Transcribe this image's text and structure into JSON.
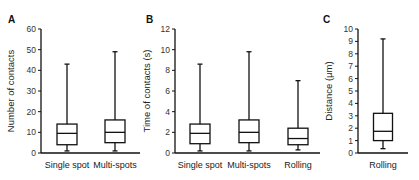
{
  "colors": {
    "stroke": "#111111",
    "box_fill": "#ffffff",
    "background": "#ffffff"
  },
  "chart_data": [
    {
      "panel": "A",
      "type": "box",
      "title": "",
      "xlabel": "",
      "ylabel": "Number of contacts",
      "ylim": [
        0,
        60
      ],
      "yticks": [
        0,
        10,
        20,
        30,
        40,
        50,
        60
      ],
      "grid": false,
      "categories": [
        "Single spot",
        "Multi-spots"
      ],
      "series": [
        {
          "name": "Single spot",
          "min": 1,
          "q1": 4,
          "median": 9.5,
          "q3": 14,
          "max": 43
        },
        {
          "name": "Multi-spots",
          "min": 1,
          "q1": 5,
          "median": 10,
          "q3": 16,
          "max": 49
        }
      ]
    },
    {
      "panel": "B",
      "type": "box",
      "title": "",
      "xlabel": "",
      "ylabel": "Time of contacts (s)",
      "ylim": [
        0,
        12
      ],
      "yticks": [
        0,
        2,
        4,
        6,
        8,
        10,
        12
      ],
      "grid": false,
      "categories": [
        "Single spot",
        "Multi-spots",
        "Rolling"
      ],
      "series": [
        {
          "name": "Single spot",
          "min": 0.2,
          "q1": 0.9,
          "median": 1.9,
          "q3": 2.8,
          "max": 8.6
        },
        {
          "name": "Multi-spots",
          "min": 0.2,
          "q1": 1.0,
          "median": 2.0,
          "q3": 3.2,
          "max": 9.8
        },
        {
          "name": "Rolling",
          "min": 0.3,
          "q1": 0.8,
          "median": 1.4,
          "q3": 2.4,
          "max": 7.0
        }
      ]
    },
    {
      "panel": "C",
      "type": "box",
      "title": "",
      "xlabel": "",
      "ylabel": "Distance (μm)",
      "ylim": [
        0,
        10
      ],
      "yticks": [
        0,
        1,
        2,
        3,
        4,
        5,
        6,
        7,
        8,
        9,
        10
      ],
      "grid": false,
      "categories": [
        "Rolling"
      ],
      "series": [
        {
          "name": "Rolling",
          "min": 0.35,
          "q1": 1.0,
          "median": 1.75,
          "q3": 3.2,
          "max": 9.2
        }
      ]
    }
  ],
  "layout": {
    "plot_top": 29,
    "plot_bottom": 153,
    "panels": [
      {
        "axis_x": 41,
        "axis_end": 140,
        "letter_x": 8,
        "letter_y": 23,
        "ylabel_x": 14,
        "box_centers": [
          67,
          115
        ],
        "box_width": 20
      },
      {
        "axis_x": 175,
        "axis_end": 320,
        "letter_x": 146,
        "letter_y": 23,
        "ylabel_x": 150,
        "box_centers": [
          200,
          249,
          298
        ],
        "box_width": 20
      },
      {
        "axis_x": 358,
        "axis_end": 408,
        "letter_x": 323,
        "letter_y": 23,
        "ylabel_x": 332,
        "box_centers": [
          383
        ],
        "box_width": 19
      }
    ]
  }
}
